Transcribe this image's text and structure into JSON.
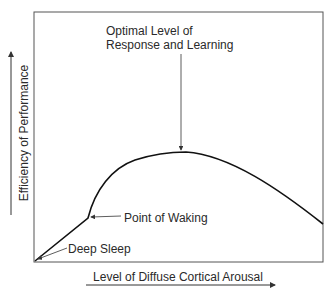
{
  "diagram": {
    "y_axis_label": "Efficiency of Performance",
    "x_axis_label": "Level of Diffuse Cortical Arousal",
    "annotations": {
      "optimal_line1": "Optimal Level of",
      "optimal_line2": "Response and Learning",
      "waking": "Point of Waking",
      "deep_sleep": "Deep Sleep"
    },
    "colors": {
      "line": "#111111",
      "frame": "#555555",
      "text": "#2a2a2a",
      "background": "#ffffff"
    }
  }
}
